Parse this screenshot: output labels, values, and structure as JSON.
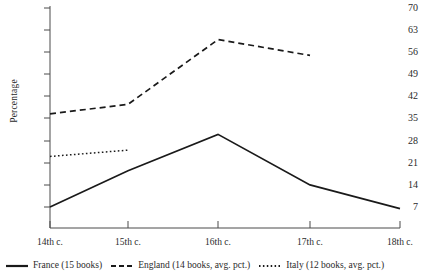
{
  "chart_data": {
    "type": "line",
    "title": "",
    "xlabel": "",
    "ylabel": "Percentage",
    "categories": [
      "14th c.",
      "15th c.",
      "16th c.",
      "17th c.",
      "18th c."
    ],
    "ylim": [
      0,
      70
    ],
    "yticks": [
      7,
      14,
      21,
      28,
      35,
      42,
      49,
      56,
      63,
      70
    ],
    "grid": false,
    "legend_position": "bottom",
    "series": [
      {
        "name": "France (15 books)",
        "style": "solid",
        "color": "#1a1a1a",
        "values": [
          7,
          18.5,
          30,
          14,
          6.5
        ]
      },
      {
        "name": "England (14 books, avg. pct.)",
        "style": "dashed",
        "color": "#1a1a1a",
        "values": [
          36.5,
          39.5,
          60,
          55,
          null
        ]
      },
      {
        "name": "Italy (12 books, avg. pct.)",
        "style": "dotted",
        "color": "#1a1a1a",
        "values": [
          23,
          25,
          null,
          null,
          null
        ]
      }
    ]
  },
  "axis": {
    "y_label": "Percentage",
    "y_ticks": [
      "70",
      "63",
      "56",
      "49",
      "42",
      "35",
      "28",
      "21",
      "14",
      "7"
    ],
    "x_ticks": [
      "14th c.",
      "15th c.",
      "16th c.",
      "17th c.",
      "18th c."
    ]
  },
  "legend": {
    "entries": [
      {
        "label": "France (15 books)",
        "style": "solid"
      },
      {
        "label": "England (14 books, avg. pct.)",
        "style": "dashed"
      },
      {
        "label": "Italy (12 books, avg. pct.)",
        "style": "dotted"
      }
    ]
  }
}
